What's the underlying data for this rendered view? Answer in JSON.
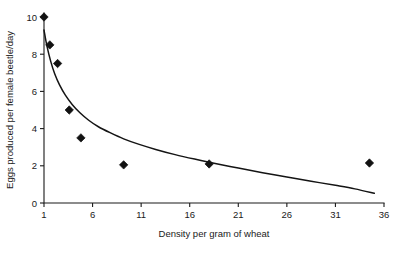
{
  "chart_data": {
    "type": "scatter",
    "title": "",
    "xlabel": "Density per gram of wheat",
    "ylabel": "Eggs produced per female beetle/day",
    "xlim": [
      1,
      36
    ],
    "ylim": [
      0,
      10
    ],
    "grid": false,
    "legend": null,
    "xticks": [
      1,
      6,
      11,
      16,
      21,
      26,
      31,
      36
    ],
    "xtick_labels": [
      "1",
      "6",
      "11",
      "16",
      "21",
      "26",
      "31",
      "36"
    ],
    "yticks": [
      0,
      2,
      4,
      6,
      8,
      10
    ],
    "ytick_labels": [
      "0",
      "2",
      "4",
      "6",
      "8",
      "10"
    ],
    "marker_style": "filled-diamond",
    "marker_color": "#121212",
    "curve_color": "#141414",
    "points": [
      {
        "x": 1.0,
        "y": 10.0
      },
      {
        "x": 1.6,
        "y": 8.5
      },
      {
        "x": 2.4,
        "y": 7.5
      },
      {
        "x": 3.6,
        "y": 5.0
      },
      {
        "x": 4.8,
        "y": 3.5
      },
      {
        "x": 9.2,
        "y": 2.05
      },
      {
        "x": 18.0,
        "y": 2.1
      },
      {
        "x": 34.5,
        "y": 2.15
      }
    ],
    "fit_curve": {
      "label": "fitted decay curve",
      "points": [
        {
          "x": 1.0,
          "y": 9.3
        },
        {
          "x": 1.3,
          "y": 8.45
        },
        {
          "x": 1.7,
          "y": 7.6
        },
        {
          "x": 2.1,
          "y": 6.95
        },
        {
          "x": 2.6,
          "y": 6.35
        },
        {
          "x": 3.2,
          "y": 5.8
        },
        {
          "x": 3.9,
          "y": 5.3
        },
        {
          "x": 4.7,
          "y": 4.85
        },
        {
          "x": 5.6,
          "y": 4.45
        },
        {
          "x": 6.6,
          "y": 4.1
        },
        {
          "x": 7.8,
          "y": 3.78
        },
        {
          "x": 9.2,
          "y": 3.45
        },
        {
          "x": 10.8,
          "y": 3.15
        },
        {
          "x": 12.5,
          "y": 2.88
        },
        {
          "x": 14.5,
          "y": 2.6
        },
        {
          "x": 16.5,
          "y": 2.36
        },
        {
          "x": 18.5,
          "y": 2.14
        },
        {
          "x": 21.0,
          "y": 1.88
        },
        {
          "x": 23.5,
          "y": 1.63
        },
        {
          "x": 26.0,
          "y": 1.4
        },
        {
          "x": 28.5,
          "y": 1.17
        },
        {
          "x": 31.0,
          "y": 0.95
        },
        {
          "x": 33.0,
          "y": 0.76
        },
        {
          "x": 35.0,
          "y": 0.52
        }
      ]
    }
  }
}
